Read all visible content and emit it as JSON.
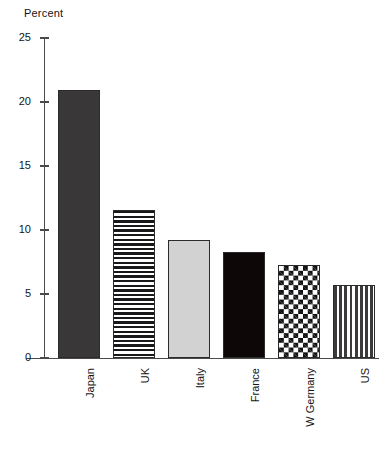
{
  "chart_data": {
    "type": "bar",
    "title": "",
    "subtitle": "",
    "xlabel": "",
    "ylabel": "Percent",
    "categories": [
      "Japan",
      "UK",
      "Italy",
      "France",
      "W Germany",
      "US"
    ],
    "values": [
      20.9,
      11.6,
      9.2,
      8.3,
      7.3,
      5.7
    ],
    "series": [
      {
        "name": "Percent",
        "values": [
          20.9,
          11.6,
          9.2,
          8.3,
          7.3,
          5.7
        ]
      }
    ],
    "ylim": [
      0,
      25
    ],
    "yticks": [
      0,
      5,
      10,
      15,
      20,
      25
    ],
    "ytick_labels": [
      "0",
      "5",
      "10",
      "15",
      "20",
      "25"
    ],
    "grid": false,
    "legend": null,
    "annotations": [],
    "bar_fills": [
      "dark-gray-solid",
      "horizontal-stripes",
      "light-gray-solid",
      "black-solid",
      "checkerboard",
      "vertical-stripes"
    ]
  },
  "axis": {
    "y_title": "Percent"
  },
  "colors": {
    "axis": "#4a4a4a",
    "text": "#141414",
    "background": "#ffffff",
    "bar_dark_gray": "#3a3738",
    "bar_black": "#0d0708",
    "bar_light_gray": "#d2d2d2",
    "pattern_ink": "#18181a"
  }
}
